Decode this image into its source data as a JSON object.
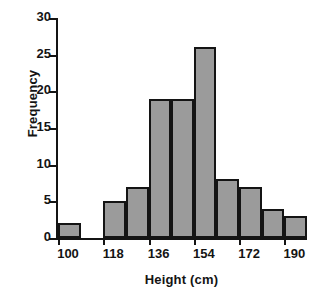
{
  "chart_data": {
    "type": "bar",
    "title": "",
    "subtitle": "",
    "xlabel": "Height (cm)",
    "ylabel": "Frequency",
    "xlim": [
      100,
      199
    ],
    "ylim": [
      0,
      30
    ],
    "bin_width": 9,
    "grid": false,
    "legend": null,
    "bar_fill_color": "#9b9b9b",
    "bar_edge_color": "#141414",
    "axis_color": "#141414",
    "background_color": "#ffffff",
    "y_ticks": [
      0,
      5,
      10,
      15,
      20,
      25,
      30
    ],
    "y_tick_labels": [
      "0",
      "5",
      "10",
      "15",
      "20",
      "25",
      "30"
    ],
    "x_ticks": [
      100,
      118,
      136,
      154,
      172,
      190
    ],
    "x_tick_labels": [
      "100",
      "118",
      "136",
      "154",
      "172",
      "190"
    ],
    "bins": [
      {
        "start": 100,
        "end": 109,
        "value": 2
      },
      {
        "start": 109,
        "end": 118,
        "value": 0
      },
      {
        "start": 118,
        "end": 127,
        "value": 5
      },
      {
        "start": 127,
        "end": 136,
        "value": 7
      },
      {
        "start": 136,
        "end": 145,
        "value": 19
      },
      {
        "start": 145,
        "end": 154,
        "value": 19
      },
      {
        "start": 154,
        "end": 163,
        "value": 26
      },
      {
        "start": 163,
        "end": 172,
        "value": 8
      },
      {
        "start": 172,
        "end": 181,
        "value": 7
      },
      {
        "start": 181,
        "end": 190,
        "value": 4
      },
      {
        "start": 190,
        "end": 199,
        "value": 3
      }
    ],
    "categories": [
      "100-109",
      "109-118",
      "118-127",
      "127-136",
      "136-145",
      "145-154",
      "154-163",
      "163-172",
      "172-181",
      "181-190",
      "190-199"
    ],
    "values": [
      2,
      0,
      5,
      7,
      19,
      19,
      26,
      8,
      7,
      4,
      3
    ]
  }
}
